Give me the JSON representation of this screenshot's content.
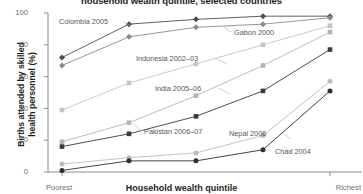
{
  "chart": {
    "title": "household wealth quintile, selected countries",
    "xlabel": "Household wealth quintile",
    "ylabel_line1": "Births attended by skilled",
    "ylabel_line2": "health personnel (%)",
    "x_tick_first": "Poorest",
    "x_tick_last": "Richest",
    "y_ticks": [
      "100",
      "80",
      "60",
      "40",
      "20",
      "0"
    ]
  },
  "labels": {
    "colombia": "Colombia 2005",
    "gabon": "Gabon 2000",
    "indonesia": "Indonesia 2002–03",
    "india": "India 2005–06",
    "pakistan": "Pakistan 2006–07",
    "nepal": "Nepal 2006",
    "chad": "Chad 2004"
  },
  "chart_data": {
    "type": "line",
    "title": "household wealth quintile, selected countries",
    "xlabel": "Household wealth quintile",
    "ylabel": "Births attended by skilled health personnel (%)",
    "categories": [
      "Poorest",
      "2",
      "3",
      "4",
      "Richest"
    ],
    "xtick_labels_shown": [
      "Poorest",
      "Richest"
    ],
    "ylim": [
      0,
      100
    ],
    "yticks": [
      0,
      20,
      40,
      60,
      80,
      100
    ],
    "grid": false,
    "legend": "inline-annotations",
    "series": [
      {
        "name": "Colombia 2005",
        "values": [
          72,
          93,
          96,
          98,
          98
        ],
        "color": "#4d4d4d",
        "marker": "diamond"
      },
      {
        "name": "Gabon 2000",
        "values": [
          67,
          85,
          91,
          93,
          97
        ],
        "color": "#8a8a8a",
        "marker": "diamond"
      },
      {
        "name": "Indonesia 2002–03",
        "values": [
          39,
          56,
          68,
          80,
          92
        ],
        "color": "#c4c4c4",
        "marker": "square"
      },
      {
        "name": "India 2005–06",
        "values": [
          19,
          31,
          48,
          67,
          88
        ],
        "color": "#b4b4b4",
        "marker": "square"
      },
      {
        "name": "Pakistan 2006–07",
        "values": [
          16,
          24,
          35,
          51,
          77
        ],
        "color": "#3a3a3a",
        "marker": "square"
      },
      {
        "name": "Nepal 2006",
        "values": [
          5,
          9,
          12,
          23,
          57
        ],
        "color": "#bdbdbd",
        "marker": "circle"
      },
      {
        "name": "Chad 2004",
        "values": [
          1,
          7,
          7,
          14,
          51
        ],
        "color": "#2f2f2f",
        "marker": "circle"
      }
    ]
  }
}
